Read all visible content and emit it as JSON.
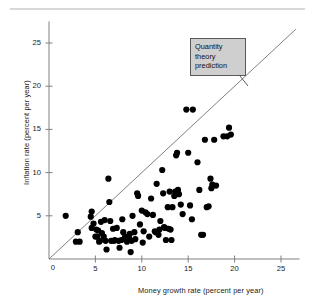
{
  "figure": {
    "top_rule_color": "#d8d8d8",
    "background": "#ffffff"
  },
  "annotation": {
    "label": "Quantity theory prediction",
    "box_fill": "#cfcfcf",
    "box_border": "#5a5a5a"
  },
  "chart_data": {
    "type": "scatter",
    "title": "",
    "xlabel": "Money growth rate (percent per year)",
    "ylabel": "Inflation rate (percent per year)",
    "xlim": [
      0,
      27
    ],
    "ylim": [
      0,
      27.5
    ],
    "xticks": [
      0,
      5,
      10,
      15,
      20,
      25
    ],
    "yticks": [
      0,
      5,
      10,
      15,
      20,
      25
    ],
    "xtick_labels": [
      "0",
      "5",
      "10",
      "15",
      "20",
      "25"
    ],
    "ytick_labels": [
      "0",
      "5",
      "10",
      "15",
      "20",
      "25"
    ],
    "grid": false,
    "legend": null,
    "marker_color": "#000000",
    "marker_size": 3.1,
    "reference_line": {
      "name": "Quantity theory prediction",
      "type": "identity",
      "slope": 1,
      "intercept": 0,
      "x_start": 0,
      "x_end": 26.6,
      "color": "#808080"
    },
    "annotations": [
      {
        "text": "Quantity theory prediction",
        "x": 15.8,
        "y": 23.6,
        "leader_to_x": 16.3,
        "leader_to_y": 16.6
      }
    ],
    "points": [
      [
        1.8,
        5.0
      ],
      [
        2.9,
        2.0
      ],
      [
        3.3,
        2.0
      ],
      [
        3.1,
        3.1
      ],
      [
        4.5,
        4.9
      ],
      [
        4.6,
        5.5
      ],
      [
        4.6,
        3.6
      ],
      [
        4.8,
        4.1
      ],
      [
        5.0,
        2.6
      ],
      [
        5.1,
        3.4
      ],
      [
        5.2,
        2.6
      ],
      [
        5.3,
        3.3
      ],
      [
        5.4,
        2.0
      ],
      [
        5.5,
        2.1
      ],
      [
        5.6,
        4.3
      ],
      [
        5.7,
        3.0
      ],
      [
        5.9,
        2.6
      ],
      [
        6.0,
        4.5
      ],
      [
        6.1,
        2.1
      ],
      [
        6.2,
        1.1
      ],
      [
        6.4,
        9.3
      ],
      [
        6.5,
        6.6
      ],
      [
        6.6,
        4.4
      ],
      [
        6.7,
        2.1
      ],
      [
        6.9,
        3.5
      ],
      [
        7.0,
        2.1
      ],
      [
        7.1,
        2.2
      ],
      [
        7.3,
        3.6
      ],
      [
        7.5,
        2.1
      ],
      [
        7.6,
        1.3
      ],
      [
        7.8,
        2.2
      ],
      [
        7.9,
        4.6
      ],
      [
        8.0,
        3.1
      ],
      [
        8.2,
        2.6
      ],
      [
        8.4,
        2.0
      ],
      [
        8.5,
        2.2
      ],
      [
        8.6,
        2.5
      ],
      [
        8.7,
        2.9
      ],
      [
        8.8,
        0.8
      ],
      [
        8.9,
        2.1
      ],
      [
        9.0,
        5.0
      ],
      [
        9.2,
        3.1
      ],
      [
        9.3,
        2.3
      ],
      [
        9.5,
        7.6
      ],
      [
        9.6,
        7.3
      ],
      [
        9.8,
        4.0
      ],
      [
        10.0,
        5.6
      ],
      [
        10.1,
        1.9
      ],
      [
        10.2,
        3.2
      ],
      [
        10.4,
        5.4
      ],
      [
        10.6,
        5.2
      ],
      [
        10.8,
        2.6
      ],
      [
        11.0,
        7.0
      ],
      [
        11.2,
        5.1
      ],
      [
        11.4,
        3.2
      ],
      [
        11.5,
        3.1
      ],
      [
        11.6,
        8.7
      ],
      [
        11.8,
        2.8
      ],
      [
        11.9,
        3.4
      ],
      [
        12.0,
        4.4
      ],
      [
        12.2,
        10.3
      ],
      [
        12.3,
        7.6
      ],
      [
        12.4,
        3.7
      ],
      [
        12.5,
        3.6
      ],
      [
        12.6,
        2.2
      ],
      [
        12.8,
        6.0
      ],
      [
        12.9,
        3.5
      ],
      [
        13.0,
        7.8
      ],
      [
        13.1,
        3.4
      ],
      [
        13.2,
        2.2
      ],
      [
        13.3,
        6.0
      ],
      [
        13.5,
        7.3
      ],
      [
        13.6,
        7.8
      ],
      [
        13.7,
        12.0
      ],
      [
        13.8,
        12.3
      ],
      [
        13.9,
        8.0
      ],
      [
        14.0,
        7.5
      ],
      [
        14.2,
        6.3
      ],
      [
        14.4,
        5.2
      ],
      [
        14.8,
        17.3
      ],
      [
        15.5,
        17.3
      ],
      [
        15.0,
        12.3
      ],
      [
        15.2,
        6.2
      ],
      [
        15.4,
        4.6
      ],
      [
        16.0,
        11.2
      ],
      [
        16.2,
        8.0
      ],
      [
        16.4,
        2.8
      ],
      [
        16.6,
        2.8
      ],
      [
        16.8,
        13.8
      ],
      [
        17.0,
        6.0
      ],
      [
        17.2,
        6.1
      ],
      [
        17.4,
        9.3
      ],
      [
        17.5,
        8.2
      ],
      [
        17.6,
        8.6
      ],
      [
        17.8,
        13.8
      ],
      [
        18.0,
        8.5
      ],
      [
        18.8,
        14.2
      ],
      [
        19.2,
        14.2
      ],
      [
        19.4,
        15.2
      ],
      [
        19.6,
        14.4
      ]
    ]
  }
}
